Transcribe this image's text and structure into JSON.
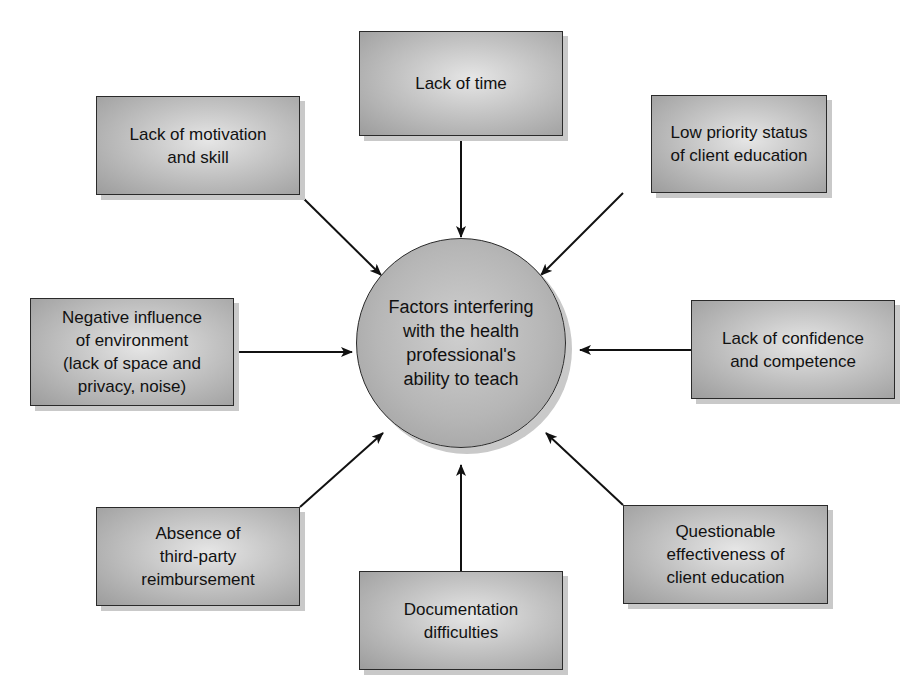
{
  "diagram": {
    "type": "hub-and-spoke",
    "center": {
      "label": "Factors interfering\nwith the health\nprofessional's\nability to teach"
    },
    "factors": [
      {
        "id": "time",
        "label": "Lack of time"
      },
      {
        "id": "motivation",
        "label": "Lack of motivation\nand skill"
      },
      {
        "id": "priority",
        "label": "Low priority status\nof client education"
      },
      {
        "id": "environment",
        "label": "Negative influence\nof environment\n(lack of space and\nprivacy, noise)"
      },
      {
        "id": "confidence",
        "label": "Lack of confidence\nand competence"
      },
      {
        "id": "reimbursement",
        "label": "Absence of\nthird-party\nreimbursement"
      },
      {
        "id": "documentation",
        "label": "Documentation\ndifficulties"
      },
      {
        "id": "effectiveness",
        "label": "Questionable\neffectiveness of\nclient education"
      }
    ],
    "edges": [
      {
        "from": "time",
        "to": "center"
      },
      {
        "from": "motivation",
        "to": "center"
      },
      {
        "from": "priority",
        "to": "center"
      },
      {
        "from": "environment",
        "to": "center"
      },
      {
        "from": "confidence",
        "to": "center"
      },
      {
        "from": "reimbursement",
        "to": "center"
      },
      {
        "from": "documentation",
        "to": "center"
      },
      {
        "from": "effectiveness",
        "to": "center"
      }
    ]
  }
}
